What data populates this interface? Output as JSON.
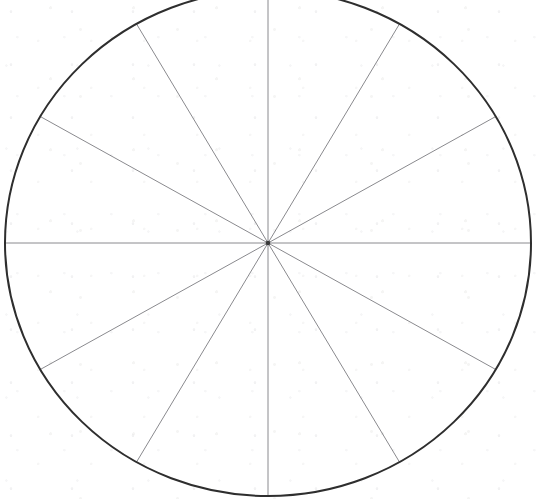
{
  "figure": {
    "title": "Blank pie chart template with twelve equal sectors",
    "kind": "pie-chart-template",
    "background_color": "#ffffff",
    "canvas": {
      "width": 544,
      "height": 499
    }
  },
  "circle": {
    "label": "pie outline",
    "center_x": 268,
    "center_y": 243,
    "radius_x": 263,
    "radius_y": 253,
    "stroke_color": "#2e2e2e",
    "stroke_width": 2.0,
    "fill_color": "none"
  },
  "spokes": {
    "label": "sector divider radii",
    "count": 12,
    "stroke_color": "#8a8a8e",
    "stroke_width": 1.0,
    "angles_deg": [
      0,
      30,
      60,
      90,
      120,
      150,
      180,
      210,
      240,
      270,
      300,
      330
    ]
  },
  "chart_data": {
    "type": "pie",
    "title": "Blank pie chart template with twelve equal sectors",
    "subtitle": "",
    "xlabel": "",
    "ylabel": "",
    "legend_position": "none",
    "grid": false,
    "labels": [
      "Sector 1",
      "Sector 2",
      "Sector 3",
      "Sector 4",
      "Sector 5",
      "Sector 6",
      "Sector 7",
      "Sector 8",
      "Sector 9",
      "Sector 10",
      "Sector 11",
      "Sector 12"
    ],
    "values": [
      8.3333,
      8.3333,
      8.3333,
      8.3333,
      8.3333,
      8.3333,
      8.3333,
      8.3333,
      8.3333,
      8.3333,
      8.3333,
      8.3333
    ],
    "value_unit": "percent",
    "total": 100,
    "slice_angle_deg": 30,
    "slice_colors": [
      "none",
      "none",
      "none",
      "none",
      "none",
      "none",
      "none",
      "none",
      "none",
      "none",
      "none",
      "none"
    ],
    "data_labels_shown": false,
    "tick_labels": [],
    "annotations": []
  }
}
